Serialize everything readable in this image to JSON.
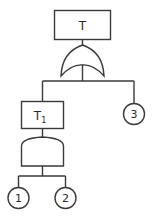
{
  "diagram": {
    "type": "fault-tree",
    "colors": {
      "line": "#3a3a3a",
      "background": "#ffffff",
      "text": "#2a2a2a"
    },
    "top_event": {
      "label": "T"
    },
    "top_gate": {
      "type": "OR"
    },
    "intermediate_event": {
      "label": "T",
      "subscript": "1"
    },
    "intermediate_gate": {
      "type": "AND"
    },
    "basic_events": [
      {
        "label": "1"
      },
      {
        "label": "2"
      },
      {
        "label": "3"
      }
    ]
  }
}
